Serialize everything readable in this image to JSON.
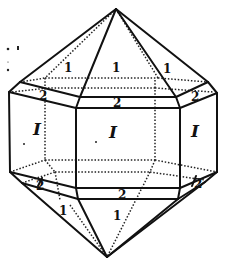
{
  "figure": {
    "colors": {
      "ink": "#111111",
      "background": "#ffffff"
    }
  },
  "labels": {
    "pyramid_top": [
      "1",
      "1",
      "1"
    ],
    "bevel_top": [
      "2",
      "2",
      "2"
    ],
    "prism": [
      "I",
      "I",
      "I"
    ],
    "bevel_bottom": [
      "2",
      "2",
      "2"
    ],
    "pyramid_bottom": [
      "1",
      "1"
    ]
  }
}
